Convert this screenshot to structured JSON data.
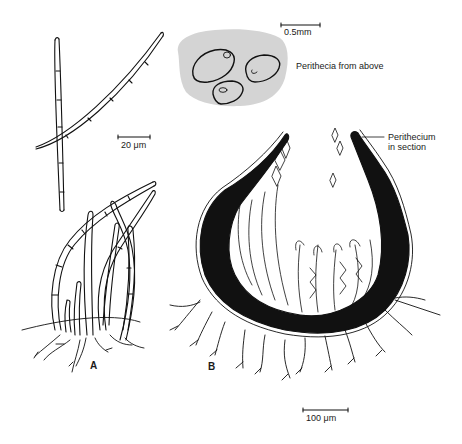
{
  "figure": {
    "panels": [
      {
        "id": "A",
        "label": "A"
      },
      {
        "id": "B",
        "label": "B"
      }
    ],
    "labels": {
      "perithecia_above": "Perithecia from above",
      "perithecium_section_line1": "Perithecium",
      "perithecium_section_line2": "in section"
    },
    "scale_bars": {
      "top": "0.5mm",
      "hyphae": "20 μm",
      "section": "100 μm"
    },
    "colors": {
      "ink": "#111111",
      "stroma_fill": "#d4d4d4",
      "background": "#ffffff"
    }
  }
}
